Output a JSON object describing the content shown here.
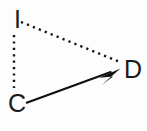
{
  "diagram": {
    "type": "directed-graph",
    "background_color": "#fdfdfd",
    "stroke_color": "#111111",
    "label_color": "#1a1a1a",
    "nodes": [
      {
        "id": "I",
        "label": "I",
        "x": 14,
        "y": 28
      },
      {
        "id": "C",
        "label": "C",
        "x": 8,
        "y": 112
      },
      {
        "id": "D",
        "label": "D",
        "x": 124,
        "y": 78
      }
    ],
    "edges": [
      {
        "id": "edge-i-c",
        "from": "I",
        "to": "C",
        "style": "dotted",
        "arrow": false,
        "x1": 14,
        "y1": 35,
        "x2": 14,
        "y2": 88
      },
      {
        "id": "edge-i-d",
        "from": "I",
        "to": "D",
        "style": "dotted",
        "arrow": false,
        "x1": 21,
        "y1": 22,
        "x2": 120,
        "y2": 62
      },
      {
        "id": "edge-c-d",
        "from": "C",
        "to": "D",
        "style": "solid",
        "arrow": true,
        "x1": 26,
        "y1": 103,
        "x2": 119,
        "y2": 69
      }
    ]
  }
}
